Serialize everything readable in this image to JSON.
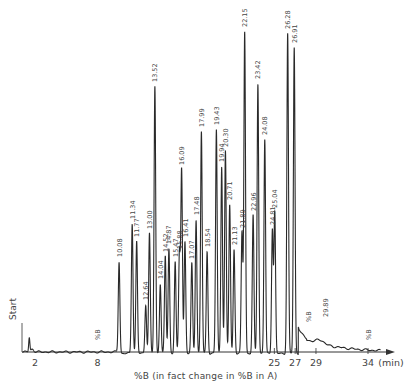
{
  "chart_data": {
    "type": "line",
    "title": "",
    "xlabel": "%B (in fact change in %B in A)",
    "x_unit": "(min)",
    "ylabel": "",
    "start_label": "Start",
    "x_ticks": [
      2,
      8,
      25,
      27,
      29,
      34
    ],
    "grid": false,
    "peaks": [
      {
        "label": "10.08",
        "t": 10.08,
        "height": 92
      },
      {
        "label": "11.34",
        "t": 11.34,
        "height": 130
      },
      {
        "label": "11.77",
        "t": 11.77,
        "height": 112
      },
      {
        "label": "12.64",
        "t": 12.64,
        "height": 49
      },
      {
        "label": "13.00",
        "t": 13.0,
        "height": 120
      },
      {
        "label": "13.52",
        "t": 13.52,
        "height": 267
      },
      {
        "label": "14.04",
        "t": 14.04,
        "height": 70
      },
      {
        "label": "14.52",
        "t": 14.52,
        "height": 97
      },
      {
        "label": "14.87",
        "t": 14.87,
        "height": 105
      },
      {
        "label": "15.47",
        "t": 15.47,
        "height": 92
      },
      {
        "label": "15.88",
        "t": 15.88,
        "height": 100
      },
      {
        "label": "16.09",
        "t": 16.09,
        "height": 184
      },
      {
        "label": "16.41",
        "t": 16.41,
        "height": 112
      },
      {
        "label": "17.07",
        "t": 17.07,
        "height": 90
      },
      {
        "label": "17.48",
        "t": 17.48,
        "height": 134
      },
      {
        "label": "17.99",
        "t": 17.99,
        "height": 222
      },
      {
        "label": "18.54",
        "t": 18.54,
        "height": 102
      },
      {
        "label": "19.43",
        "t": 19.43,
        "height": 224
      },
      {
        "label": "19.94",
        "t": 19.94,
        "height": 187
      },
      {
        "label": "20.30",
        "t": 20.3,
        "height": 202
      },
      {
        "label": "20.71",
        "t": 20.71,
        "height": 149
      },
      {
        "label": "21.13",
        "t": 21.13,
        "height": 104
      },
      {
        "label": "21.89",
        "t": 21.89,
        "height": 121
      },
      {
        "label": "22.15",
        "t": 22.15,
        "height": 322
      },
      {
        "label": "22.96",
        "t": 22.96,
        "height": 138
      },
      {
        "label": "23.42",
        "t": 23.42,
        "height": 270
      },
      {
        "label": "24.08",
        "t": 24.08,
        "height": 214
      },
      {
        "label": "24.81",
        "t": 24.81,
        "height": 124
      },
      {
        "label": "25.04",
        "t": 25.04,
        "height": 141
      },
      {
        "label": "26.28",
        "t": 26.28,
        "height": 320
      },
      {
        "label": "26.91",
        "t": 26.91,
        "height": 306
      }
    ],
    "annotations": [
      {
        "label": "%B",
        "t": 8.0
      },
      {
        "label": "%B",
        "t": 28.3
      },
      {
        "label": "29.89",
        "t": 29.89
      },
      {
        "label": "%B",
        "t": 34.0
      }
    ]
  },
  "colors": {
    "trace": "#2a2a2a",
    "axis": "#333333",
    "text": "#444444"
  }
}
